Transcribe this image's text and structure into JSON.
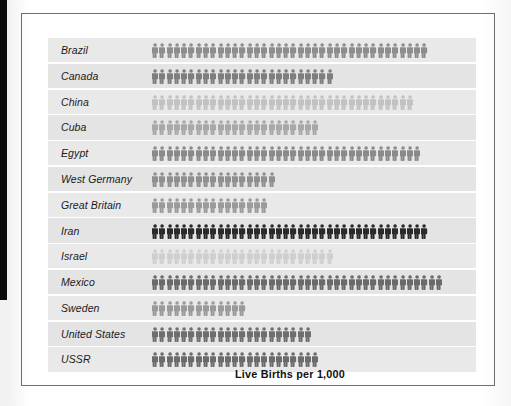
{
  "chart_data": {
    "type": "bar",
    "subtype": "pictograph",
    "title": "Live Births per 1,000",
    "xlabel": "",
    "ylabel": "",
    "unit_label": "Live Births per 1,000",
    "symbol": "person-figure",
    "categories": [
      "Brazil",
      "Canada",
      "China",
      "Cuba",
      "Egypt",
      "West Germany",
      "Great Britain",
      "Iran",
      "Israel",
      "Mexico",
      "Sweden",
      "United States",
      "USSR"
    ],
    "values": [
      38,
      25,
      36,
      23,
      37,
      17,
      16,
      38,
      25,
      40,
      13,
      22,
      23
    ],
    "symbol_colors": [
      "#8d8d8d",
      "#7e7e7e",
      "#c2c2c2",
      "#a8a8a8",
      "#8a8a8a",
      "#8f8f8f",
      "#9b9b9b",
      "#2a2a2a",
      "#cfcfcf",
      "#6a6a6a",
      "#9a9a9a",
      "#6e6e6e",
      "#6b6b6b"
    ],
    "rows": [
      {
        "label": "Brazil",
        "count": 38,
        "color": "#8d8d8d"
      },
      {
        "label": "Canada",
        "count": 25,
        "color": "#7e7e7e"
      },
      {
        "label": "China",
        "count": 36,
        "color": "#c2c2c2"
      },
      {
        "label": "Cuba",
        "count": 23,
        "color": "#a8a8a8"
      },
      {
        "label": "Egypt",
        "count": 37,
        "color": "#8a8a8a"
      },
      {
        "label": "West Germany",
        "count": 17,
        "color": "#8f8f8f"
      },
      {
        "label": "Great Britain",
        "count": 16,
        "color": "#9b9b9b"
      },
      {
        "label": "Iran",
        "count": 38,
        "color": "#2a2a2a"
      },
      {
        "label": "Israel",
        "count": 25,
        "color": "#cfcfcf"
      },
      {
        "label": "Mexico",
        "count": 40,
        "color": "#6a6a6a"
      },
      {
        "label": "Sweden",
        "count": 13,
        "color": "#9a9a9a"
      },
      {
        "label": "United States",
        "count": 22,
        "color": "#6e6e6e"
      },
      {
        "label": "USSR",
        "count": 23,
        "color": "#6b6b6b"
      }
    ],
    "grid": false,
    "legend": "none"
  },
  "figure": {
    "band_color": "#e9e9e9",
    "panel_border_color": "#6f6f6f",
    "background": "#ffffff"
  }
}
